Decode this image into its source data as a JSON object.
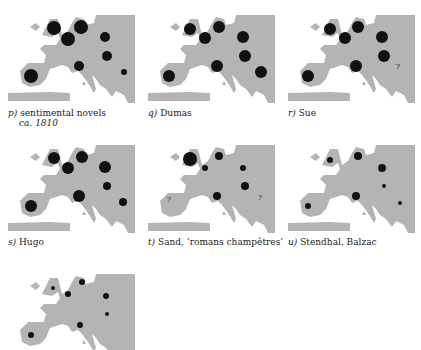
{
  "figure": {
    "land_color": "#b4b4b4",
    "dot_color": "#111111",
    "panels": [
      {
        "letter": "p)",
        "label": "sentimental novels",
        "sublabel": "ca. 1810",
        "dots": [
          [
            54,
            23,
            7
          ],
          [
            68,
            34,
            7
          ],
          [
            81,
            22,
            7
          ],
          [
            105,
            32,
            5
          ],
          [
            107,
            51,
            5
          ],
          [
            79,
            61,
            5
          ],
          [
            31,
            71,
            7
          ],
          [
            124,
            67,
            3
          ]
        ],
        "question": []
      },
      {
        "letter": "q)",
        "label": "Dumas",
        "dots": [
          [
            50,
            24,
            6
          ],
          [
            65,
            33,
            6
          ],
          [
            79,
            22,
            6
          ],
          [
            103,
            32,
            6
          ],
          [
            105,
            51,
            6
          ],
          [
            77,
            61,
            6
          ],
          [
            29,
            71,
            6
          ],
          [
            121,
            67,
            6
          ]
        ],
        "question": []
      },
      {
        "letter": "r)",
        "label": "Sue",
        "dots": [
          [
            50,
            24,
            6
          ],
          [
            65,
            33,
            6
          ],
          [
            78,
            22,
            6
          ],
          [
            102,
            32,
            6
          ],
          [
            104,
            51,
            6
          ],
          [
            76,
            61,
            6
          ],
          [
            28,
            71,
            6
          ]
        ],
        "question": [
          [
            118,
            64
          ]
        ]
      },
      {
        "letter": "s)",
        "label": "Hugo",
        "dots": [
          [
            54,
            23,
            6
          ],
          [
            68,
            33,
            6
          ],
          [
            82,
            22,
            6
          ],
          [
            105,
            32,
            6
          ],
          [
            107,
            51,
            4
          ],
          [
            79,
            61,
            6
          ],
          [
            31,
            71,
            6
          ],
          [
            123,
            67,
            4
          ]
        ],
        "question": []
      },
      {
        "letter": "t)",
        "label": "Sand, ‘romans champêtres’",
        "dots": [
          [
            50,
            24,
            7
          ],
          [
            65,
            33,
            3
          ],
          [
            79,
            21,
            4
          ],
          [
            103,
            33,
            3
          ],
          [
            105,
            51,
            4
          ],
          [
            77,
            61,
            4
          ]
        ],
        "question": [
          [
            29,
            67
          ],
          [
            120,
            65
          ]
        ]
      },
      {
        "letter": "u)",
        "label": "Stendhal, Balzac",
        "dots": [
          [
            50,
            25,
            3
          ],
          [
            78,
            21,
            4
          ],
          [
            102,
            33,
            4
          ],
          [
            104,
            51,
            2
          ],
          [
            76,
            61,
            4
          ],
          [
            28,
            71,
            3
          ],
          [
            120,
            68,
            2
          ]
        ],
        "question": []
      },
      {
        "letter": "",
        "label": "",
        "dots": [
          [
            53,
            30,
            2
          ],
          [
            68,
            36,
            3
          ],
          [
            82,
            24,
            3
          ],
          [
            106,
            38,
            3
          ],
          [
            107,
            56,
            2
          ],
          [
            80,
            67,
            3
          ],
          [
            31,
            77,
            3
          ]
        ],
        "question": []
      }
    ]
  }
}
